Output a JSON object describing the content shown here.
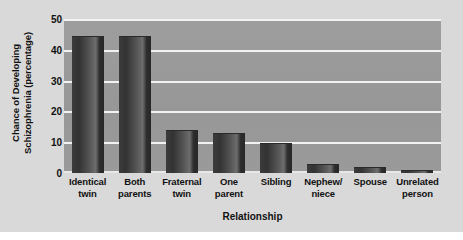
{
  "chart_data": {
    "type": "bar",
    "title": "",
    "xlabel": "Relationship",
    "ylabel_lines": [
      "Chance of Developing",
      "Schizophrenia (percentage)"
    ],
    "ylabel": "Chance of Developing Schizophrenia (percentage)",
    "categories": [
      "Identical twin",
      "Both parents",
      "Fraternal twin",
      "One parent",
      "Sibling",
      "Nephew/ niece",
      "Spouse",
      "Unrelated person"
    ],
    "category_lines": [
      [
        "Identical",
        "twin"
      ],
      [
        "Both",
        "parents"
      ],
      [
        "Fraternal",
        "twin"
      ],
      [
        "One",
        "parent"
      ],
      [
        "Sibling",
        ""
      ],
      [
        "Nephew/",
        "niece"
      ],
      [
        "Spouse",
        ""
      ],
      [
        "Unrelated",
        "person"
      ]
    ],
    "values": [
      45,
      45,
      14,
      13,
      10,
      3,
      2,
      1
    ],
    "ylim": [
      0,
      50
    ],
    "yticks": [
      0,
      10,
      20,
      30,
      40,
      50
    ],
    "ytick_labels": [
      "0",
      "10",
      "20",
      "30",
      "40",
      "50"
    ],
    "grid": true,
    "grid_axis": "y",
    "legend": false,
    "legend_position": "none",
    "colors": {
      "figure_background": "#d9d9d9",
      "plot_background": "#9a9a9a",
      "gridline": "#f2f2f2",
      "bar_dark": "#333333",
      "bar_light": "#6d6d6d",
      "text": "#111111"
    }
  }
}
